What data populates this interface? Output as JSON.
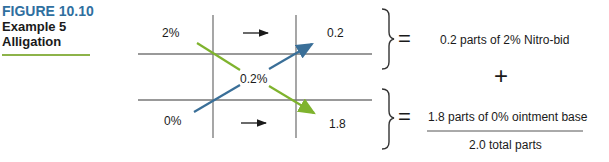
{
  "caption": {
    "figure_number": "FIGURE 10.10",
    "line1": "Example 5",
    "line2": "Alligation",
    "accent_color": "#8db34a",
    "number_color": "#2f6f9f"
  },
  "grid": {
    "top_left": "2%",
    "bottom_left": "0%",
    "center": "0.2%",
    "top_right": "0.2",
    "bottom_right": "1.8"
  },
  "arrows": {
    "green_color": "#7fb32e",
    "blue_color": "#3a6f98"
  },
  "results": {
    "top_equals": "=",
    "top_text": "0.2 parts of 2% Nitro-bid",
    "plus": "+",
    "bottom_equals": "=",
    "bottom_text": "1.8 parts of 0% ointment base",
    "total_text": "2.0 total parts"
  }
}
